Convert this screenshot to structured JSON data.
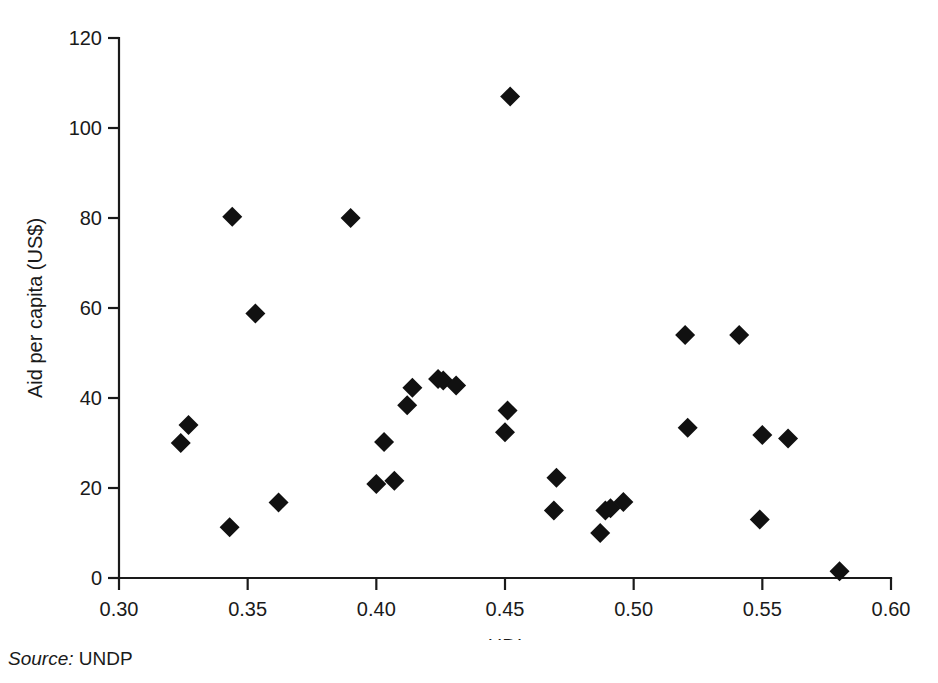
{
  "figure": {
    "source_label": "Source:",
    "source_value": "UNDP"
  },
  "chart_data": {
    "type": "scatter",
    "title": "",
    "xlabel": "HDI",
    "ylabel": "Aid per capita (US$)",
    "xlim": [
      0.3,
      0.6
    ],
    "ylim": [
      0,
      120
    ],
    "xticks": [
      0.3,
      0.35,
      0.4,
      0.45,
      0.5,
      0.55,
      0.6
    ],
    "xtick_labels": [
      "0.30",
      "0.35",
      "0.40",
      "0.45",
      "0.50",
      "0.55",
      "0.60"
    ],
    "yticks": [
      0,
      20,
      40,
      60,
      80,
      100,
      120
    ],
    "ytick_labels": [
      "0",
      "20",
      "40",
      "60",
      "80",
      "100",
      "120"
    ],
    "grid": false,
    "legend": null,
    "marker": "diamond",
    "marker_color": "#111111",
    "marker_size": 17,
    "x": [
      0.324,
      0.327,
      0.343,
      0.344,
      0.353,
      0.362,
      0.39,
      0.4,
      0.403,
      0.407,
      0.412,
      0.414,
      0.424,
      0.426,
      0.431,
      0.45,
      0.451,
      0.452,
      0.469,
      0.47,
      0.487,
      0.489,
      0.491,
      0.496,
      0.52,
      0.521,
      0.541,
      0.549,
      0.55,
      0.56,
      0.58
    ],
    "y": [
      30.0,
      34.0,
      11.3,
      80.3,
      58.8,
      16.8,
      80.0,
      20.9,
      30.2,
      21.6,
      38.4,
      42.3,
      44.2,
      43.9,
      42.8,
      32.4,
      37.2,
      107.0,
      15.0,
      22.3,
      10.0,
      15.0,
      15.5,
      16.9,
      54.0,
      33.4,
      54.0,
      13.0,
      31.8,
      31.0,
      1.5
    ]
  }
}
